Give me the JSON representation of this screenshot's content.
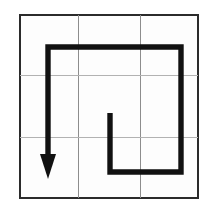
{
  "figure": {
    "background_color": "#ffffff",
    "cell_fill_color": "#fdfdfd",
    "grid": {
      "border_color": "#2b2b2b",
      "line_color": "#8d8d8d",
      "faint_line_color": "#b2b2b2",
      "left": 20,
      "top": 15,
      "right": 198,
      "bottom": 198,
      "columns": 3,
      "rows": 3,
      "vertical_lines_x": [
        78,
        140
      ],
      "horizontal_lines_y": [
        75,
        137
      ]
    },
    "path": {
      "name": "hook-path",
      "color": "#111111",
      "stroke_width": 5.4,
      "description": "Inward hook: starts at inner stub, runs down, right, up, left along the top, then turns down and ends in an arrowhead.",
      "points": "110,113 110,172 181,172 181,47 48,47 48,156",
      "start_point": [
        110,
        113
      ],
      "end_point": [
        48,
        156
      ]
    },
    "arrow": {
      "name": "arrow-head",
      "color": "#111111",
      "direction": "down",
      "tip": [
        48,
        179
      ],
      "polygon": "48,179 40,154 56,154",
      "width": 16,
      "height": 25
    }
  }
}
